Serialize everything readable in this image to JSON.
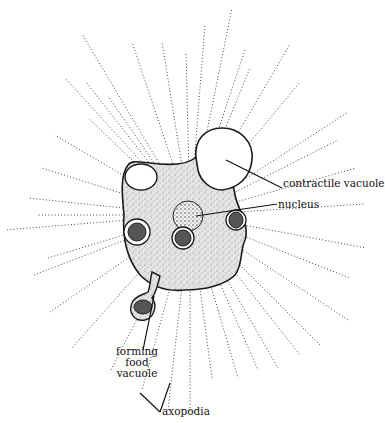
{
  "figure": {
    "labels": {
      "contractile_vacuole": "contractile vacuole",
      "nucleus": "nucleus",
      "forming_food_vacuole": [
        "forming",
        "food",
        "vacuole"
      ],
      "axopodia": "axopodia"
    },
    "colors": {
      "ink": "#1a1a1a",
      "stipple": "#555555",
      "cell_fill": "#d9d9d9",
      "background": "#ffffff"
    }
  }
}
